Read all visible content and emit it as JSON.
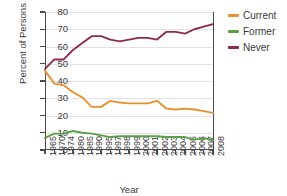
{
  "chart_data": {
    "type": "line",
    "title": "",
    "xlabel": "Year",
    "ylabel": "Percent of Persons",
    "ylim": [
      0,
      80
    ],
    "yticks": [
      0,
      10,
      20,
      30,
      40,
      50,
      60,
      70,
      80
    ],
    "grid": true,
    "legend_position": "right",
    "categories": [
      "1965",
      "1970",
      "1974",
      "1980",
      "1985",
      "1990",
      "1995",
      "1997",
      "1998",
      "1999",
      "2000",
      "2001",
      "2002",
      "2003",
      "2004",
      "2005",
      "2006",
      "2007",
      "2008"
    ],
    "series": [
      {
        "name": "Current",
        "color": "#E8922F",
        "values": [
          46.0,
          38.5,
          37.5,
          33.5,
          30.5,
          25.0,
          25.0,
          28.5,
          27.5,
          27.0,
          27.0,
          27.0,
          28.5,
          24.0,
          23.5,
          24.0,
          23.5,
          22.5,
          21.5
        ]
      },
      {
        "name": "Former",
        "color": "#5BA049",
        "values": [
          7.0,
          9.5,
          9.5,
          11.0,
          10.0,
          9.5,
          8.5,
          7.5,
          8.0,
          8.0,
          8.0,
          8.0,
          8.0,
          7.5,
          7.5,
          7.5,
          6.0,
          7.0,
          5.5
        ]
      },
      {
        "name": "Never",
        "color": "#8E2B4C",
        "values": [
          47.0,
          52.5,
          52.5,
          58.0,
          62.0,
          66.0,
          66.0,
          64.0,
          63.0,
          64.0,
          65.0,
          65.0,
          64.0,
          68.5,
          68.5,
          67.5,
          70.0,
          71.5,
          73.0
        ]
      }
    ]
  },
  "legend": {
    "items": [
      {
        "label": "Current",
        "color": "#E8922F"
      },
      {
        "label": "Former",
        "color": "#5BA049"
      },
      {
        "label": "Never",
        "color": "#8E2B4C"
      }
    ]
  },
  "axes": {
    "y_title": "Percent of Persons",
    "x_title": "Year"
  }
}
